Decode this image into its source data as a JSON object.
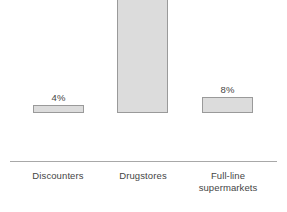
{
  "chart_data": {
    "type": "bar",
    "title": "",
    "subtitle": "",
    "xlabel": "",
    "ylabel": "",
    "categories": [
      "Discounters",
      "Drugstores",
      "Full-line supermarkets"
    ],
    "values": [
      4,
      63,
      8
    ],
    "value_labels": [
      "4%",
      "63%",
      "8%"
    ],
    "unit": "%",
    "ylim": [
      0,
      63
    ],
    "grid": false,
    "legend": false,
    "axis_visible": {
      "x": true,
      "y": false
    },
    "series": [
      {
        "name": "Share",
        "values": [
          4,
          63,
          8
        ]
      }
    ],
    "colors": {
      "bar_fill": "#dcdcdc",
      "bar_border": "#9a9a9a",
      "axis_line": "#a8a8a8",
      "text": "#454545",
      "background": "#ffffff"
    }
  },
  "bars": [
    {
      "category_line1": "Discounters",
      "category_line2": "",
      "value_label": "4%"
    },
    {
      "category_line1": "Drugstores",
      "category_line2": "",
      "value_label": "63%"
    },
    {
      "category_line1": "Full-line",
      "category_line2": "supermarkets",
      "value_label": "8%"
    }
  ]
}
